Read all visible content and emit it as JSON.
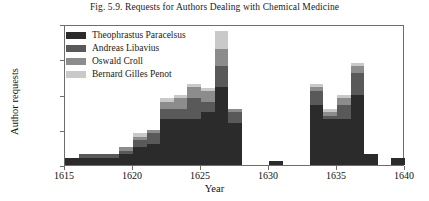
{
  "chart_data": {
    "type": "bar",
    "stacked": true,
    "title": "Fig. 5.9. Requests for Authors Dealing with Chemical Medicine",
    "xlabel": "Year",
    "ylabel": "Author requests",
    "xlim": [
      1615,
      1640
    ],
    "ylim": [
      0,
      40
    ],
    "yticks": [
      0,
      10,
      20,
      30,
      40
    ],
    "xticks": [
      1615,
      1620,
      1625,
      1630,
      1635,
      1640
    ],
    "grid": false,
    "legend_position": "top-left",
    "categories": [
      1615,
      1616,
      1617,
      1618,
      1619,
      1620,
      1621,
      1622,
      1623,
      1624,
      1625,
      1626,
      1627,
      1628,
      1629,
      1630,
      1631,
      1632,
      1633,
      1634,
      1635,
      1636,
      1637,
      1638,
      1639
    ],
    "series": [
      {
        "name": "Theophrastus Paracelsus",
        "color": "#2b2b2b",
        "values": [
          2,
          2,
          2,
          2,
          3,
          5,
          6,
          13,
          13,
          13,
          15,
          22,
          12,
          0,
          0,
          1,
          0,
          0,
          17,
          13,
          13,
          20,
          3,
          0,
          2
        ]
      },
      {
        "name": "Andreas Libavius",
        "color": "#595959",
        "values": [
          0,
          1,
          1,
          1,
          1,
          2,
          3,
          3,
          3,
          6,
          3,
          6,
          3,
          0,
          0,
          0,
          0,
          0,
          4,
          1,
          4,
          6,
          0,
          0,
          0
        ]
      },
      {
        "name": "Oswald Croll",
        "color": "#8c8c8c",
        "values": [
          0,
          0,
          0,
          0,
          1,
          1,
          1,
          2,
          3,
          3,
          3,
          5,
          1,
          0,
          0,
          0,
          0,
          0,
          1,
          1,
          2,
          2,
          0,
          0,
          0
        ]
      },
      {
        "name": "Bernard Gilles Penot",
        "color": "#c9c9c9",
        "values": [
          0,
          0,
          0,
          0,
          0,
          1,
          0,
          1,
          1,
          1,
          1,
          5,
          0,
          0,
          0,
          0,
          0,
          0,
          1,
          1,
          1,
          1,
          0,
          0,
          0
        ]
      }
    ],
    "totals": [
      2,
      3,
      3,
      3,
      5,
      9,
      10,
      19,
      20,
      23,
      22,
      38,
      16,
      0,
      0,
      1,
      0,
      0,
      23,
      16,
      20,
      29,
      3,
      0,
      2
    ]
  },
  "axis_colors": {
    "frame": "#6d6d6d",
    "text": "#111111"
  }
}
